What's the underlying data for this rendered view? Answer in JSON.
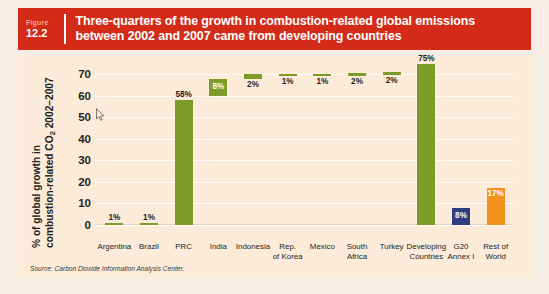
{
  "figure": {
    "word": "Figure",
    "number": "12.2",
    "title": "Three-quarters of the growth in combustion-related global emissions between 2002 and 2007 came from developing countries"
  },
  "source": "Source: Carbon Dioxide Information Analysis Center.",
  "colors": {
    "header_red": "#d42a18",
    "panel_bg": "#fcebd9",
    "green": "#7d9b28",
    "blue": "#2d3e7e",
    "orange": "#f5921e",
    "gridline": "#ffffff",
    "text": "#231f20"
  },
  "chart_data": {
    "type": "bar",
    "title": "Three-quarters of the growth in combustion-related global emissions between 2002 and 2007 came from developing countries",
    "xlabel": "",
    "ylabel": "% of global growth in combustion-related CO₂ 2002–2007",
    "ylabel_line1": "% of global growth in",
    "ylabel_line2_pre": "combustion-related CO",
    "ylabel_line2_sub": "2",
    "ylabel_line2_post": " 2002–2007",
    "ylim": [
      0,
      72
    ],
    "yticks": [
      0,
      10,
      20,
      30,
      40,
      50,
      60,
      70
    ],
    "grid": true,
    "legend": "none",
    "waterfall": true,
    "categories": [
      "Argentina",
      "Brazil",
      "PRC",
      "India",
      "Indonesia",
      "Rep. of Korea",
      "Mexico",
      "South Africa",
      "Turkey",
      "Developing Countries",
      "G20 Annex I",
      "Rest of World"
    ],
    "category_lines": [
      [
        "Argentina"
      ],
      [
        "Brazil"
      ],
      [
        "PRC"
      ],
      [
        "India"
      ],
      [
        "Indonesia"
      ],
      [
        "Rep.",
        "of Korea"
      ],
      [
        "Mexico"
      ],
      [
        "South",
        "Africa"
      ],
      [
        "Turkey"
      ],
      [
        "Developing",
        "Countries"
      ],
      [
        "G20",
        "Annex I"
      ],
      [
        "Rest of",
        "World"
      ]
    ],
    "values": [
      1,
      1,
      58,
      8,
      2,
      1,
      1,
      2,
      2,
      75,
      8,
      17
    ],
    "labels": [
      "1%",
      "1%",
      "58%",
      "8%",
      "2%",
      "1%",
      "1%",
      "2%",
      "2%",
      "75%",
      "8%",
      "17%"
    ],
    "bases": [
      0,
      0,
      0,
      60,
      68,
      69.5,
      69.5,
      69.5,
      70,
      0,
      0,
      0
    ],
    "tops": [
      1,
      1,
      58,
      68,
      70,
      70.2,
      70.2,
      70.5,
      71,
      75,
      8,
      17
    ],
    "bar_colors": [
      "green",
      "green",
      "green",
      "green",
      "green",
      "green",
      "green",
      "green",
      "green",
      "green",
      "blue",
      "orange"
    ],
    "label_positions": [
      "above",
      "above",
      "inside-top",
      "inside",
      "below",
      "below",
      "below",
      "below",
      "below",
      "inside-top",
      "inside",
      "inside-top"
    ]
  }
}
